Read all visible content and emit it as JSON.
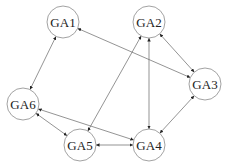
{
  "diagram": {
    "type": "directed-graph",
    "node_radius": 16,
    "nodes": [
      {
        "id": "GA1",
        "label": "GA1",
        "x": 63,
        "y": 22
      },
      {
        "id": "GA2",
        "label": "GA2",
        "x": 149,
        "y": 22
      },
      {
        "id": "GA3",
        "label": "GA3",
        "x": 205,
        "y": 84
      },
      {
        "id": "GA4",
        "label": "GA4",
        "x": 149,
        "y": 145
      },
      {
        "id": "GA5",
        "label": "GA5",
        "x": 80,
        "y": 145
      },
      {
        "id": "GA6",
        "label": "GA6",
        "x": 23,
        "y": 104
      }
    ],
    "edges": [
      {
        "from": "GA1",
        "to": "GA6",
        "bidirectional": true
      },
      {
        "from": "GA1",
        "to": "GA3",
        "bidirectional": true
      },
      {
        "from": "GA2",
        "to": "GA3",
        "bidirectional": true
      },
      {
        "from": "GA2",
        "to": "GA5",
        "bidirectional": true
      },
      {
        "from": "GA2",
        "to": "GA4",
        "bidirectional": true
      },
      {
        "from": "GA3",
        "to": "GA4",
        "bidirectional": true
      },
      {
        "from": "GA6",
        "to": "GA5",
        "bidirectional": true
      },
      {
        "from": "GA6",
        "to": "GA4",
        "bidirectional": true
      },
      {
        "from": "GA5",
        "to": "GA4",
        "bidirectional": true
      }
    ],
    "colors": {
      "node_stroke": "#8a8a8a",
      "edge": "#666666",
      "text": "#222222",
      "background": "#ffffff"
    }
  }
}
